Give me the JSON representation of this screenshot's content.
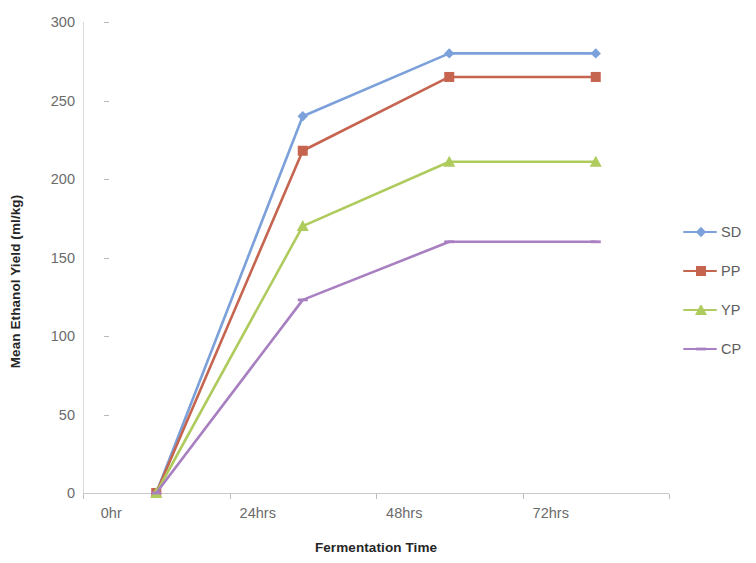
{
  "chart_data": {
    "type": "line",
    "title": "",
    "xlabel": "Fermentation Time",
    "ylabel": "Mean Ethanol Yield (ml/kg)",
    "categories": [
      "0hr",
      "24hrs",
      "48hrs",
      "72hrs"
    ],
    "ylim": [
      0,
      300
    ],
    "yticks": [
      0,
      50,
      100,
      150,
      200,
      250,
      300
    ],
    "ytick_labels": [
      "0",
      "50",
      "100",
      "150",
      "200",
      "250",
      "300"
    ],
    "grid": false,
    "legend_position": "right",
    "series": [
      {
        "name": "SD",
        "values": [
          0,
          240,
          280,
          280
        ],
        "color": "#7CA0D9",
        "marker": "diamond"
      },
      {
        "name": "PP",
        "values": [
          0,
          218,
          265,
          265
        ],
        "color": "#C5644F",
        "marker": "square"
      },
      {
        "name": "YP",
        "values": [
          0,
          170,
          211,
          211
        ],
        "color": "#AFCB5E",
        "marker": "triangle"
      },
      {
        "name": "CP",
        "values": [
          0,
          123,
          160,
          160
        ],
        "color": "#A87FC0",
        "marker": "dash"
      }
    ]
  },
  "axis": {
    "y_title": "Mean Ethanol Yield (ml/kg)",
    "x_title": "Fermentation Time"
  },
  "legend": {
    "entries": [
      {
        "label": "SD"
      },
      {
        "label": "PP"
      },
      {
        "label": "YP"
      },
      {
        "label": "CP"
      }
    ]
  }
}
